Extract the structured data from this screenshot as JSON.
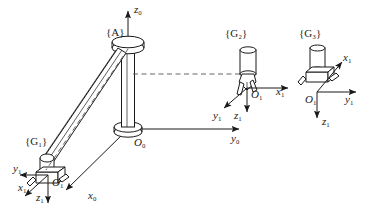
{
  "figure": {
    "type": "line-diagram",
    "width": 370,
    "height": 212,
    "background_color": "#ffffff",
    "stroke_color": "#1a1a1a",
    "dashed_color": "#555555"
  },
  "labels": {
    "frame_A": "{A}",
    "frame_G1_left": "{G₁}",
    "frame_G2_middle": "{G₂}",
    "frame_G3_right": "{G₃}",
    "origin_O0": "O",
    "origin_O0_sub": "0",
    "origin_O1_left": "O",
    "origin_O1_left_sub": "1",
    "origin_O1_middle": "O",
    "origin_O1_middle_sub": "1",
    "origin_O1_right": "O",
    "origin_O1_right_sub": "1",
    "axis_z0": "z",
    "axis_z0_sub": "0",
    "axis_y0": "y",
    "axis_y0_sub": "0",
    "axis_x0": "x",
    "axis_x0_sub": "0",
    "axis_x1_left": "x",
    "axis_x1_left_sub": "1",
    "axis_y1_left": "y",
    "axis_y1_left_sub": "1",
    "axis_z1_left": "z",
    "axis_z1_left_sub": "1",
    "axis_x1_middle": "x",
    "axis_x1_middle_sub": "1",
    "axis_y1_middle": "y",
    "axis_y1_middle_sub": "1",
    "axis_z1_middle": "z",
    "axis_z1_middle_sub": "1",
    "axis_x1_right": "x",
    "axis_x1_right_sub": "1",
    "axis_y1_right": "y",
    "axis_y1_right_sub": "1",
    "axis_z1_right": "z",
    "axis_z1_right_sub": "1"
  },
  "geometry": {
    "base_origin": [
      128,
      129
    ],
    "column_top": [
      128,
      45
    ],
    "arm_elbow": [
      42,
      168
    ],
    "z0_tip": [
      128,
      8
    ],
    "y0_tip": [
      243,
      129
    ],
    "x0_tip": [
      63,
      193
    ],
    "gripper_middle_origin": [
      247,
      88
    ],
    "gripper_right_origin": [
      317,
      92
    ],
    "gripper_left_origin": [
      48,
      175
    ]
  }
}
